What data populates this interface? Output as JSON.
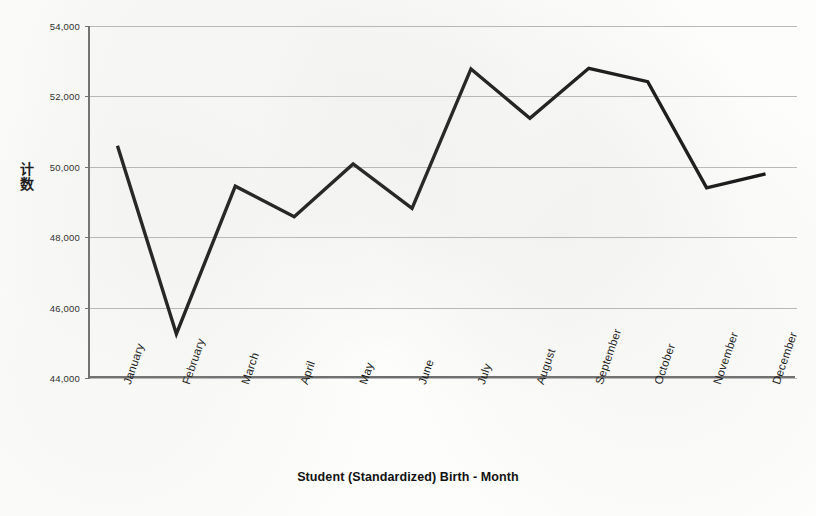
{
  "chart_data": {
    "type": "line",
    "title": "",
    "xlabel": "Student (Standardized) Birth - Month",
    "ylabel": "计数",
    "categories": [
      "January",
      "February",
      "March",
      "April",
      "May",
      "June",
      "July",
      "August",
      "September",
      "October",
      "November",
      "December"
    ],
    "values": [
      50600,
      45250,
      49450,
      48580,
      50080,
      48820,
      52780,
      51380,
      52800,
      52420,
      49400,
      49800
    ],
    "series": [
      {
        "name": "Count",
        "values": [
          50600,
          45250,
          49450,
          48580,
          50080,
          48820,
          52780,
          51380,
          52800,
          52420,
          49400,
          49800
        ]
      }
    ],
    "ylim": [
      44000,
      54000
    ],
    "y_ticks": [
      44000,
      46000,
      48000,
      50000,
      52000,
      54000
    ],
    "y_tick_labels": [
      "44,000",
      "46,000",
      "48,000",
      "50,000",
      "52,000",
      "54,000"
    ],
    "grid": true,
    "legend": false,
    "legend_position": "none",
    "line_color": "#141414",
    "grid_color": "#b9b9b9",
    "axis_color": "#6d6d6d",
    "background_color": "#fdfdfb"
  }
}
